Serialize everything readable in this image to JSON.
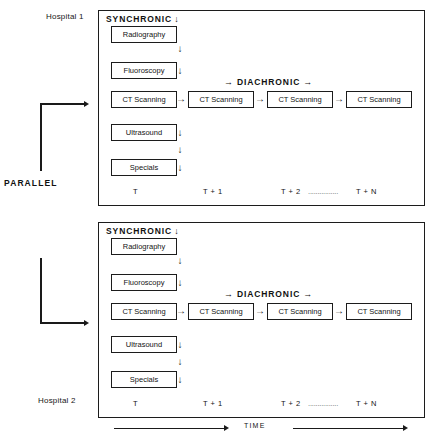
{
  "figure": {
    "parallel_label": "PARALLEL",
    "time_axis_label": "TIME",
    "arrow_right": "→",
    "arrow_down": "↓"
  },
  "panels": [
    {
      "hospital_label": "Hospital 1",
      "synchronic_label": "SYNCHRONIC",
      "diachronic_label": "DIACHRONIC",
      "modalities": [
        "Radiography",
        "Fluoroscopy",
        "CT Scanning",
        "Ultrasound",
        "Specials"
      ],
      "diachronic_boxes": [
        "CT Scanning",
        "CT Scanning",
        "CT Scanning"
      ],
      "time_ticks": [
        "T",
        "T + 1",
        "T + 2",
        "T + N"
      ],
      "tick_dots": "................"
    },
    {
      "hospital_label": "Hospital 2",
      "synchronic_label": "SYNCHRONIC",
      "diachronic_label": "DIACHRONIC",
      "modalities": [
        "Radiography",
        "Fluoroscopy",
        "CT Scanning",
        "Ultrasound",
        "Specials"
      ],
      "diachronic_boxes": [
        "CT Scanning",
        "CT Scanning",
        "CT Scanning"
      ],
      "time_ticks": [
        "T",
        "T + 1",
        "T + 2",
        "T + N"
      ],
      "tick_dots": "................"
    }
  ]
}
